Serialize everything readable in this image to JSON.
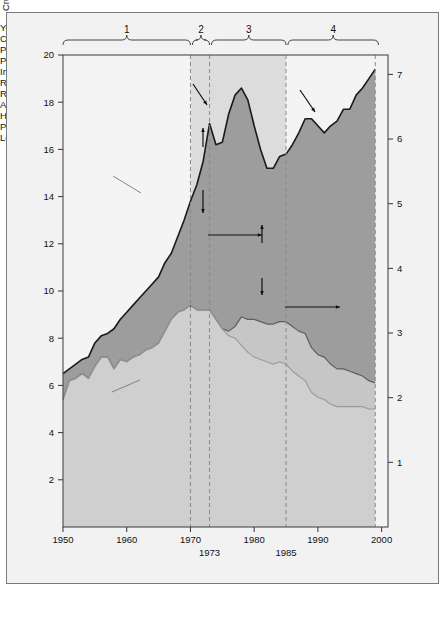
{
  "figure": {
    "background": "#f2f2f2",
    "border_color": "#7b7b7b"
  },
  "axes": {
    "x": {
      "label": "Year",
      "ticks": [
        "1950",
        "1960",
        "1970",
        "1980",
        "1990",
        "2000"
      ],
      "tick_values": [
        1950,
        1960,
        1970,
        1980,
        1990,
        2000
      ],
      "extra_ticks": [
        {
          "label": "1973",
          "value": 1973
        },
        {
          "label": "1985",
          "value": 1985
        }
      ],
      "range": [
        1950,
        2001
      ]
    },
    "y_left": {
      "label": "Crude oil (millions of barrels per day)",
      "ticks": [
        "2",
        "4",
        "6",
        "8",
        "10",
        "12",
        "14",
        "16",
        "18",
        "20"
      ],
      "tick_values": [
        2,
        4,
        6,
        8,
        10,
        12,
        14,
        16,
        18,
        20
      ],
      "range": [
        0,
        20
      ]
    },
    "y_right": {
      "label": "Crude oil (billions of barrels per year)",
      "ticks": [
        "1",
        "2",
        "3",
        "4",
        "5",
        "6",
        "7"
      ],
      "tick_values": [
        1,
        2,
        3,
        4,
        5,
        6,
        7
      ],
      "range": [
        0,
        7.3
      ]
    }
  },
  "period_braces": [
    {
      "label": "1",
      "start": 1950,
      "end": 1970
    },
    {
      "label": "2",
      "start": 1970.3,
      "end": 1973
    },
    {
      "label": "3",
      "start": 1973.3,
      "end": 1985
    },
    {
      "label": "4",
      "start": 1985.3,
      "end": 1999.5
    }
  ],
  "dashed_lines": [
    1970,
    1973,
    1985,
    1999
  ],
  "annotations": {
    "consumption": "Consumption",
    "production_lower48": "Production\nfrom lower\n48 states",
    "production_alaska": "Production\nfrom  Alaska",
    "imported_oil": "Imported\noil",
    "recession_74_75": "Recession\nof '74–'75",
    "recession_1990_92": "Recession\nof 1990–'92",
    "arab_embargo": "Arab\nembargo\n1973",
    "high_oil_prices": "High oil\nprices",
    "price_collapse": "Price\ncollapse",
    "low_oil_prices": "Low oil\nprices"
  },
  "colors": {
    "imported_band": "#9d9d9d",
    "alaska_band": "#c6c6c6",
    "lower48_band": "#cfcfcf",
    "upper_shaded_band": "#dcdcdc",
    "upper_plain": "#f4f4f4",
    "line": "#1a1a1a",
    "dash": "#8a8a8a"
  },
  "chart_data": {
    "type": "area",
    "title": "",
    "xlabel": "Year",
    "ylabel": "Crude oil (millions of barrels per day)",
    "ylabel_right": "Crude oil (billions of barrels per year)",
    "xlim": [
      1950,
      2001
    ],
    "ylim": [
      0,
      20
    ],
    "ylim_right": [
      0,
      7.3
    ],
    "grid": false,
    "legend": "inline annotations",
    "x": [
      1950,
      1951,
      1952,
      1953,
      1954,
      1955,
      1956,
      1957,
      1958,
      1959,
      1960,
      1961,
      1962,
      1963,
      1964,
      1965,
      1966,
      1967,
      1968,
      1969,
      1970,
      1971,
      1972,
      1973,
      1974,
      1975,
      1976,
      1977,
      1978,
      1979,
      1980,
      1981,
      1982,
      1983,
      1984,
      1985,
      1986,
      1987,
      1988,
      1989,
      1990,
      1991,
      1992,
      1993,
      1994,
      1995,
      1996,
      1997,
      1998,
      1999
    ],
    "series": [
      {
        "name": "Consumption",
        "units": "millions of barrels per day",
        "values": [
          6.5,
          6.7,
          6.9,
          7.1,
          7.2,
          7.8,
          8.1,
          8.2,
          8.4,
          8.8,
          9.1,
          9.4,
          9.7,
          10.0,
          10.3,
          10.6,
          11.2,
          11.6,
          12.3,
          13.0,
          13.8,
          14.5,
          15.5,
          17.1,
          16.2,
          16.3,
          17.5,
          18.3,
          18.6,
          18.1,
          17.0,
          16.0,
          15.2,
          15.2,
          15.7,
          15.8,
          16.2,
          16.7,
          17.3,
          17.3,
          17.0,
          16.7,
          17.0,
          17.2,
          17.7,
          17.7,
          18.3,
          18.6,
          19.0,
          19.4
        ]
      },
      {
        "name": "Production from lower 48 states",
        "units": "millions of barrels per day",
        "values": [
          5.4,
          6.2,
          6.3,
          6.5,
          6.3,
          6.8,
          7.2,
          7.2,
          6.7,
          7.1,
          7.0,
          7.2,
          7.3,
          7.5,
          7.6,
          7.8,
          8.3,
          8.8,
          9.1,
          9.2,
          9.4,
          9.2,
          9.2,
          9.2,
          8.8,
          8.4,
          8.1,
          8.0,
          7.7,
          7.4,
          7.2,
          7.1,
          7.0,
          6.9,
          7.0,
          6.9,
          6.6,
          6.4,
          6.2,
          5.7,
          5.5,
          5.4,
          5.2,
          5.1,
          5.1,
          5.1,
          5.1,
          5.1,
          5.0,
          5.0
        ]
      },
      {
        "name": "Production from Alaska",
        "units": "millions of barrels per day",
        "values": [
          0,
          0,
          0,
          0,
          0,
          0,
          0,
          0,
          0,
          0,
          0,
          0,
          0,
          0,
          0,
          0,
          0,
          0,
          0,
          0,
          0,
          0,
          0,
          0,
          0,
          0,
          0.2,
          0.5,
          1.2,
          1.4,
          1.6,
          1.6,
          1.6,
          1.7,
          1.7,
          1.8,
          1.9,
          1.9,
          2.0,
          1.9,
          1.8,
          1.8,
          1.7,
          1.6,
          1.6,
          1.5,
          1.4,
          1.3,
          1.2,
          1.1
        ]
      }
    ],
    "stacked_bands": [
      {
        "name": "Production from lower 48 states",
        "fill": "#cfcfcf"
      },
      {
        "name": "Production from Alaska",
        "fill": "#c6c6c6"
      },
      {
        "name": "Imported oil",
        "fill": "#9d9d9d",
        "note": "Consumption minus total domestic production"
      }
    ]
  }
}
